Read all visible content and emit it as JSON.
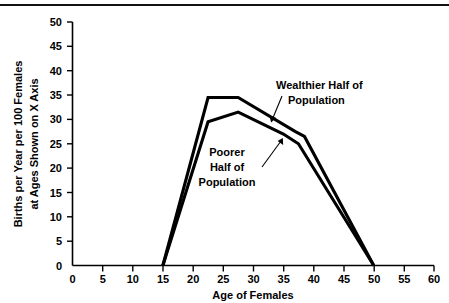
{
  "chart_data": {
    "type": "line",
    "title": "",
    "xlabel": "Age of Females",
    "ylabel": "Births per Year per 100 Females at Ages Shown on X Axis",
    "ylabel_lines": [
      "Births per Year per 100 Females",
      "at Ages Shown on X Axis"
    ],
    "xlim": [
      0,
      60
    ],
    "ylim": [
      0,
      50
    ],
    "xticks": [
      0,
      5,
      10,
      15,
      20,
      25,
      30,
      35,
      40,
      45,
      50,
      55,
      60
    ],
    "yticks": [
      0,
      5,
      10,
      15,
      20,
      25,
      30,
      35,
      40,
      45,
      50
    ],
    "xtick_labels": [
      "0",
      "5",
      "10",
      "15",
      "20",
      "25",
      "30",
      "35",
      "40",
      "45",
      "50",
      "55",
      "60"
    ],
    "ytick_labels": [
      "0",
      "5",
      "10",
      "15",
      "20",
      "25",
      "30",
      "35",
      "40",
      "45",
      "50"
    ],
    "grid": false,
    "legend_position": "inline-annotations",
    "series": [
      {
        "name": "Wealthier Half of Population",
        "label_lines": [
          "Wealthier Half of",
          "Population"
        ],
        "color": "#000000",
        "x": [
          15,
          22.5,
          27.5,
          37,
          38.5,
          50
        ],
        "values": [
          0,
          34.5,
          34.5,
          27.5,
          26.5,
          0
        ]
      },
      {
        "name": "Poorer Half of Population",
        "label_lines": [
          "Poorer",
          "Half of",
          "Population"
        ],
        "color": "#000000",
        "x": [
          15,
          22.5,
          27.5,
          35,
          37.5,
          50
        ],
        "values": [
          0,
          29.5,
          31.5,
          27,
          25,
          0
        ]
      }
    ],
    "annotations": [
      {
        "name": "wealthier-annotation",
        "lines": [
          "Wealthier Half of",
          "Population"
        ],
        "text_x": 33.5,
        "text_y": 44.0,
        "point_x": 33.2,
        "point_y": 30.0
      },
      {
        "name": "poorer-annotation",
        "lines": [
          "Poorer",
          "Half of",
          "Population"
        ],
        "text_x": 26.0,
        "text_y": 24.5,
        "point_x": 34.6,
        "point_y": 27.4
      }
    ]
  },
  "axis": {
    "x_title": "Age of Females",
    "y_title_line1": "Births per Year per 100 Females",
    "y_title_line2": "at Ages Shown on X Axis"
  }
}
